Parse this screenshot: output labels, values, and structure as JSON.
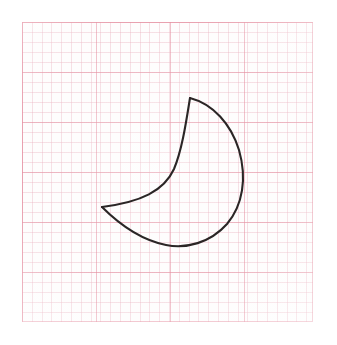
{
  "canvas": {
    "width": 337,
    "height": 345,
    "background_color": "#ffffff",
    "alt_text": "Hand-drawn crescent moon outline on pink graph paper"
  },
  "paper": {
    "name": "graph-paper",
    "left": 22,
    "top": 22,
    "width": 291,
    "height": 300,
    "background_color": "#fefdfd",
    "major_grid_color": "#e28296",
    "minor_grid_color": "#e8aab9",
    "border_color": "#e28296",
    "major_cell_width_px": 74,
    "major_cell_height_px": 50,
    "minor_cell_px": 10,
    "major_columns": 4,
    "major_rows": 6
  },
  "drawing": {
    "name": "crescent-moon",
    "title": "Crescent Moon",
    "stroke_color": "#2b2626",
    "stroke_width": 2.1,
    "fill": "none",
    "style": "hand-drawn-outline",
    "key_points": {
      "upper_cusp": [
        190,
        98
      ],
      "lower_cusp": [
        102,
        207
      ],
      "rightmost": [
        240,
        176
      ],
      "bottommost": [
        176,
        246
      ]
    },
    "bounding_box": [
      102,
      96,
      242,
      248
    ],
    "outer_arc_path": "M 190 98 C 213 104 231 124 239 150 C 247 178 243 205 227 224 C 210 243 186 249 166 245 C 141 240 118 223 102 207",
    "inner_arc_path": "M 190 98 C 186 123 182 150 174 169 C 164 191 141 202 102 207"
  }
}
